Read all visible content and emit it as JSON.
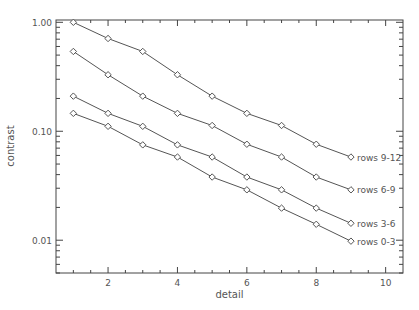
{
  "chart_data": {
    "type": "line",
    "title": "",
    "xlabel": "detail",
    "ylabel": "contrast",
    "xscale": "linear",
    "yscale": "log",
    "xlim": [
      0.5,
      10.5
    ],
    "ylim": [
      0.005,
      1.05
    ],
    "grid": false,
    "legend_position": "inline-right",
    "marker": "diamond",
    "x_ticks": [
      2,
      4,
      6,
      8,
      10
    ],
    "x_tick_labels": [
      "2",
      "4",
      "6",
      "8",
      "10"
    ],
    "y_ticks": [
      1.0,
      0.1,
      0.01
    ],
    "y_tick_labels": [
      "1.00",
      "0.10",
      "0.01"
    ],
    "x": [
      1,
      2,
      3,
      4,
      5,
      6,
      7,
      8,
      9
    ],
    "series": [
      {
        "name": "rows 9-12",
        "values": [
          1.0,
          0.71,
          0.54,
          0.33,
          0.21,
          0.146,
          0.113,
          0.076,
          0.058
        ]
      },
      {
        "name": "rows 6-9",
        "values": [
          0.54,
          0.33,
          0.21,
          0.146,
          0.113,
          0.076,
          0.058,
          0.038,
          0.029
        ]
      },
      {
        "name": "rows 3-6",
        "values": [
          0.21,
          0.146,
          0.111,
          0.075,
          0.058,
          0.038,
          0.029,
          0.0197,
          0.0143
        ]
      },
      {
        "name": "rows 0-3",
        "values": [
          0.146,
          0.111,
          0.075,
          0.058,
          0.038,
          0.029,
          0.0197,
          0.014,
          0.0098
        ]
      }
    ],
    "colors": {
      "axis": "#444444",
      "line": "#555555",
      "text": "#555555",
      "background": "#ffffff"
    }
  }
}
